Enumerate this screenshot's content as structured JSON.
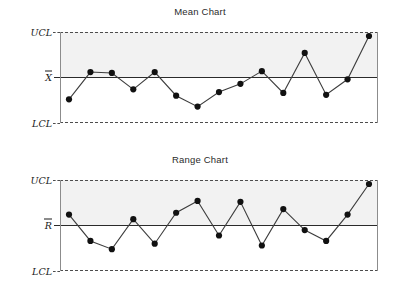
{
  "chart_data": [
    {
      "type": "line",
      "title": "Mean Chart",
      "xlabel": "",
      "ylabel": "",
      "ylim": [
        0,
        100
      ],
      "grid": false,
      "legend": "none",
      "axis_ticks": [
        {
          "label": "UCL",
          "value": 100
        },
        {
          "label": "X̄",
          "value": 50
        },
        {
          "label": "LCL",
          "value": 0
        }
      ],
      "center_line_label": "X",
      "upper_limit_label": "UCL",
      "lower_limit_label": "LCL",
      "x": [
        1,
        2,
        3,
        4,
        5,
        6,
        7,
        8,
        9,
        10,
        11,
        12,
        13,
        14,
        15
      ],
      "values": [
        26,
        56,
        55,
        37,
        56,
        30,
        18,
        34,
        43,
        57,
        33,
        77,
        31,
        48,
        100
      ]
    },
    {
      "type": "line",
      "title": "Range Chart",
      "xlabel": "",
      "ylabel": "",
      "ylim": [
        0,
        100
      ],
      "grid": false,
      "legend": "none",
      "axis_ticks": [
        {
          "label": "UCL",
          "value": 100
        },
        {
          "label": "R̄",
          "value": 50
        },
        {
          "label": "LCL",
          "value": 0
        }
      ],
      "center_line_label": "R",
      "upper_limit_label": "UCL",
      "lower_limit_label": "LCL",
      "x": [
        1,
        2,
        3,
        4,
        5,
        6,
        7,
        8,
        9,
        10,
        11,
        12,
        13,
        14,
        15
      ],
      "values": [
        62,
        33,
        24,
        57,
        30,
        64,
        77,
        39,
        76,
        28,
        68,
        45,
        33,
        62,
        100
      ]
    }
  ],
  "charts": {
    "mean": {
      "title": "Mean Chart",
      "ucl": "UCL",
      "lcl": "LCL",
      "center": "X"
    },
    "range": {
      "title": "Range Chart",
      "ucl": "UCL",
      "lcl": "LCL",
      "center": "R"
    }
  },
  "colors": {
    "band": "#f2f2f2",
    "center_line": "#2b2b2b",
    "limit_line": "#4d4d4d",
    "point": "#111111",
    "series_line": "#3d3d3d",
    "title_text": "#2b2b2b"
  }
}
